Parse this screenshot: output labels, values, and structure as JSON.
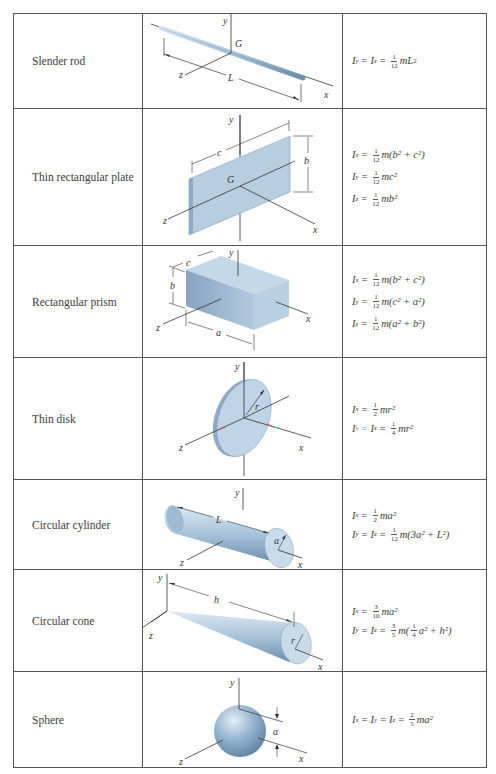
{
  "table": {
    "columns": [
      "Shape",
      "Figure",
      "Mass moments of inertia"
    ],
    "rows": [
      {
        "name": "Slender rod",
        "figure": {
          "labels": [
            "y",
            "G",
            "z",
            "L",
            "x"
          ]
        },
        "formulas": [
          {
            "lhs": [
              "I",
              "y",
              "=",
              "I",
              "z"
            ],
            "coef_num": "1",
            "coef_den": "12",
            "rhs": "mL",
            "sup": "2"
          }
        ]
      },
      {
        "name": "Thin rectangular plate",
        "figure": {
          "labels": [
            "y",
            "c",
            "b",
            "G",
            "z",
            "x"
          ]
        },
        "formulas": [
          {
            "lhs": [
              "I",
              "x"
            ],
            "coef_num": "1",
            "coef_den": "12",
            "rhs": "m(b² + c²)"
          },
          {
            "lhs": [
              "I",
              "y"
            ],
            "coef_num": "1",
            "coef_den": "12",
            "rhs": "mc²"
          },
          {
            "lhs": [
              "I",
              "z"
            ],
            "coef_num": "1",
            "coef_den": "12",
            "rhs": "mb²"
          }
        ]
      },
      {
        "name": "Rectangular prism",
        "figure": {
          "labels": [
            "y",
            "c",
            "b",
            "z",
            "a",
            "x"
          ]
        },
        "formulas": [
          {
            "lhs": [
              "I",
              "x"
            ],
            "coef_num": "1",
            "coef_den": "12",
            "rhs": "m(b² + c²)"
          },
          {
            "lhs": [
              "I",
              "y"
            ],
            "coef_num": "1",
            "coef_den": "12",
            "rhs": "m(c² + a²)"
          },
          {
            "lhs": [
              "I",
              "z"
            ],
            "coef_num": "1",
            "coef_den": "12",
            "rhs": "m(a² + b²)"
          }
        ]
      },
      {
        "name": "Thin disk",
        "figure": {
          "labels": [
            "y",
            "r",
            "z",
            "x"
          ]
        },
        "formulas": [
          {
            "lhs": [
              "I",
              "x"
            ],
            "coef_num": "1",
            "coef_den": "2",
            "rhs": "mr²"
          },
          {
            "lhs": [
              "I",
              "y",
              "=",
              "I",
              "z"
            ],
            "coef_num": "1",
            "coef_den": "4",
            "rhs": "mr²"
          }
        ]
      },
      {
        "name": "Circular cylinder",
        "figure": {
          "labels": [
            "y",
            "L",
            "a",
            "z",
            "x"
          ]
        },
        "formulas": [
          {
            "lhs": [
              "I",
              "x"
            ],
            "coef_num": "1",
            "coef_den": "2",
            "rhs": "ma²"
          },
          {
            "lhs": [
              "I",
              "y",
              "=",
              "I",
              "z"
            ],
            "coef_num": "1",
            "coef_den": "12",
            "rhs": "m(3a² + L²)"
          }
        ]
      },
      {
        "name": "Circular cone",
        "figure": {
          "labels": [
            "y",
            "h",
            "z",
            "r",
            "x"
          ]
        },
        "formulas": [
          {
            "lhs": [
              "I",
              "x"
            ],
            "coef_num": "3",
            "coef_den": "10",
            "rhs": "ma²"
          },
          {
            "lhs": [
              "I",
              "y",
              "=",
              "I",
              "z"
            ],
            "coef_num": "3",
            "coef_den": "5",
            "rhs": "m(",
            "inner_num": "1",
            "inner_den": "4",
            "rhs2": "a² + h²)"
          }
        ]
      },
      {
        "name": "Sphere",
        "figure": {
          "labels": [
            "y",
            "a",
            "z",
            "x"
          ]
        },
        "formulas": [
          {
            "lhs": [
              "I",
              "x",
              "=",
              "I",
              "y",
              "=",
              "I",
              "z"
            ],
            "coef_num": "2",
            "coef_den": "5",
            "rhs": "ma²"
          }
        ]
      }
    ]
  },
  "colors": {
    "shape_fill": "#a9c3da",
    "shape_dark": "#7e9ebd",
    "line": "#333333",
    "border": "#555555",
    "accent_red": "#c8505a",
    "accent_cyan": "#33b5c8"
  }
}
